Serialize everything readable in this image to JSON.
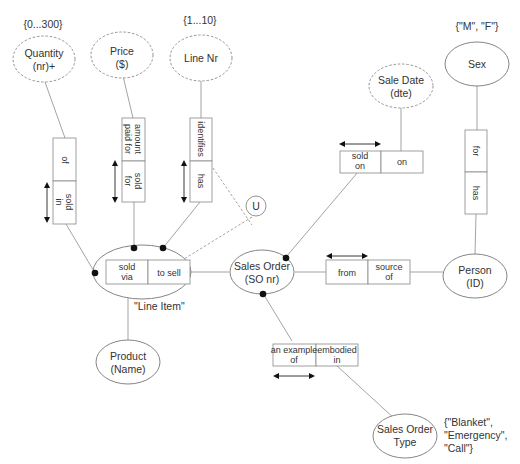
{
  "diagram": {
    "type": "ORM conceptual schema",
    "entities": {
      "quantity": {
        "line1": "Quantity",
        "line2": "(nr)+",
        "constraint": "{0...300}"
      },
      "price": {
        "line1": "Price",
        "line2": "($)"
      },
      "line_nr": {
        "line1": "Line Nr",
        "constraint": "{1...10}"
      },
      "sale_date": {
        "line1": "Sale Date",
        "line2": "(dte)"
      },
      "sex": {
        "line1": "Sex",
        "constraint": "{\"M\", \"F\"}"
      },
      "line_item": {
        "label": "\"Line Item\""
      },
      "sales_order": {
        "line1": "Sales Order",
        "line2": "(SO nr)"
      },
      "person": {
        "line1": "Person",
        "line2": "(ID)"
      },
      "product": {
        "line1": "Product",
        "line2": "(Name)"
      },
      "sales_order_type": {
        "line1": "Sales Order",
        "line2": "Type",
        "constraint_1": "{\"Blanket\",",
        "constraint_2": "\"Emergency\",",
        "constraint_3": "\"Call\"}"
      }
    },
    "facts": {
      "quantity_fact": {
        "role1": "of",
        "role2_l1": "sold",
        "role2_l2": "in"
      },
      "price_fact": {
        "role1_l1": "amount",
        "role1_l2": "paid for",
        "role2_l1": "sold",
        "role2_l2": "for"
      },
      "linenr_fact": {
        "role1": "identifies",
        "role2": "has"
      },
      "product_fact": {
        "role1_l1": "sold",
        "role1_l2": "via",
        "role2": "to sell"
      },
      "saledate_fact": {
        "role1_l1": "sold",
        "role1_l2": "on",
        "role2": "on"
      },
      "person_fact": {
        "role1": "from",
        "role2_l1": "source",
        "role2_l2": "of"
      },
      "sex_fact": {
        "role1": "for",
        "role2": "has"
      },
      "type_fact": {
        "role1_l1": "an example",
        "role1_l2": "of",
        "role2_l1": "embodied",
        "role2_l2": "in"
      }
    },
    "uniqueness_constraint": "U"
  }
}
